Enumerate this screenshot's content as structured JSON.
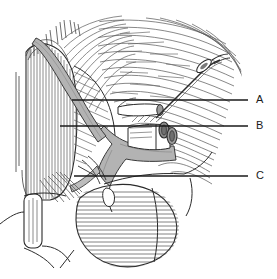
{
  "figure": {
    "type": "anatomical-line-drawing",
    "background_color": "#ffffff",
    "ink_color": "#3a3a3a",
    "outline_color": "#2b2b2b",
    "vessel_fill_color": "#b3b3b3",
    "vessel_fill_color_dark": "#9a9a9a",
    "tube_fill_color": "#8c8c8c",
    "leader_line_color": "#1a1a1a",
    "label_text_color": "#1a1a1a"
  },
  "labels": [
    {
      "id": "A",
      "text": "A",
      "text_x": 258,
      "text_y": 100,
      "line_x1": 72,
      "line_y1": 100,
      "line_x2": 248,
      "line_y2": 100
    },
    {
      "id": "B",
      "text": "B",
      "text_x": 258,
      "text_y": 126,
      "line_x1": 60,
      "line_y1": 126,
      "line_x2": 248,
      "line_y2": 126
    },
    {
      "id": "C",
      "text": "C",
      "text_x": 258,
      "text_y": 176,
      "line_x1": 74,
      "line_y1": 176,
      "line_x2": 248,
      "line_y2": 176
    }
  ],
  "regions": [
    {
      "name": "vertical-muscle-band-left",
      "description": "Vertically striated muscle belly on the left side"
    },
    {
      "name": "diagonal-vessel-nerve",
      "description": "Gray band crossing diagonally from upper left to center"
    },
    {
      "name": "branching-vessel-trunk",
      "description": "Gray Y-shaped branching vascular/nerve trunk in the center"
    },
    {
      "name": "curved-fiber-muscle-right",
      "description": "Concentric curved hatched muscle fibers filling the right side"
    },
    {
      "name": "cut-tube-upper",
      "description": "Small cut tubular structure in the mid-right region"
    },
    {
      "name": "cut-tube-lower",
      "description": "Larger cut tubular structure below, with open lumen"
    },
    {
      "name": "thin-instrument-upper-right",
      "description": "Slender elongated probe-like structure at the upper right"
    },
    {
      "name": "oval-hatched-body-bottom",
      "description": "Oval horizontally hatched rounded body at the bottom center"
    },
    {
      "name": "rounded-bone-block-lower-left",
      "description": "Rounded rectangular bone / cartilage block at lower left"
    },
    {
      "name": "fascia-contour-lines",
      "description": "Free contour lines defining fascial planes and tissue edges"
    }
  ]
}
